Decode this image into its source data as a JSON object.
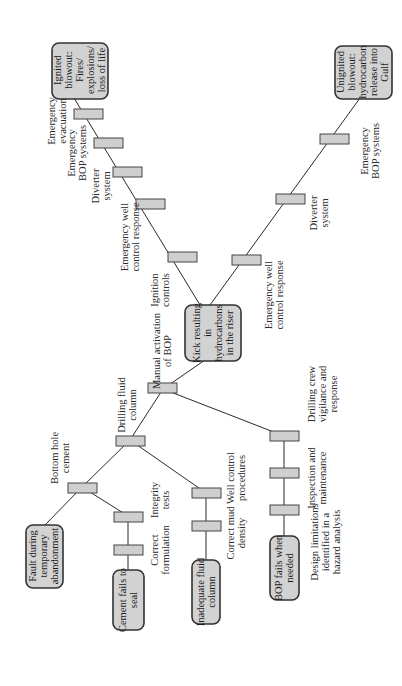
{
  "diagram": {
    "type": "bow-tie",
    "orientation": "rotated-90-ccw",
    "colors": {
      "box_fill": "#d2d2d2",
      "barrier_fill": "#cfcfcf",
      "line": "#2a2a2a",
      "background": "#ffffff"
    },
    "top_event": {
      "lines": [
        "Kick resulting",
        "in",
        "hydrocarbons",
        "in the riser"
      ]
    },
    "threats": [
      {
        "id": "fault",
        "lines": [
          "Fault during",
          "temporary",
          "abandonment"
        ]
      },
      {
        "id": "cement",
        "lines": [
          "Cement fails to",
          "seal"
        ],
        "barriers": [
          {
            "lines": [
              "Correct",
              "formulation"
            ]
          },
          {
            "lines": [
              "Integrity",
              "tests"
            ]
          }
        ]
      },
      {
        "id": "fluid",
        "lines": [
          "Inadequate fluid",
          "column"
        ],
        "barriers": [
          {
            "lines": [
              "Correct mud",
              "density"
            ]
          },
          {
            "lines": [
              "Well control",
              "procedures"
            ]
          }
        ]
      },
      {
        "id": "bop",
        "lines": [
          "BOP fails when",
          "needed"
        ],
        "barriers": [
          {
            "lines": [
              "Design limitations",
              "identified in a",
              "hazard analysis"
            ]
          },
          {
            "lines": [
              "Inspection and",
              "maintenance"
            ]
          },
          {
            "lines": [
              "Drilling crew",
              "vigilance and",
              "response"
            ]
          }
        ]
      }
    ],
    "shared_prevention_barriers": [
      {
        "id": "bottom-hole-cement",
        "lines": [
          "Bottom hole",
          "cement"
        ]
      },
      {
        "id": "drilling-fluid-column",
        "lines": [
          "Drilling fluid",
          "column"
        ]
      },
      {
        "id": "manual-activation-bop",
        "lines": [
          "Manual activation",
          "of BOP"
        ]
      }
    ],
    "consequences": [
      {
        "id": "ignited",
        "lines": [
          "Ignited",
          "blowout:",
          "Fires/",
          "explosions/",
          "loss of life"
        ],
        "barriers": [
          {
            "lines": [
              "Ignition",
              "controls"
            ]
          },
          {
            "lines": [
              "Emergency well",
              "control response"
            ]
          },
          {
            "lines": [
              "Diverter",
              "system"
            ]
          },
          {
            "lines": [
              "Emergency",
              "BOP systems"
            ]
          },
          {
            "lines": [
              "Emergency",
              "evacuation"
            ]
          }
        ]
      },
      {
        "id": "unignited",
        "lines": [
          "Unignited",
          "blowout:",
          "hydrocarbon",
          "release into",
          "Gulf"
        ],
        "barriers": [
          {
            "lines": [
              "Emergency well",
              "control response"
            ]
          },
          {
            "lines": [
              "Diverter",
              "system"
            ]
          },
          {
            "lines": [
              "Emergency",
              "BOP systems"
            ]
          }
        ]
      }
    ]
  }
}
